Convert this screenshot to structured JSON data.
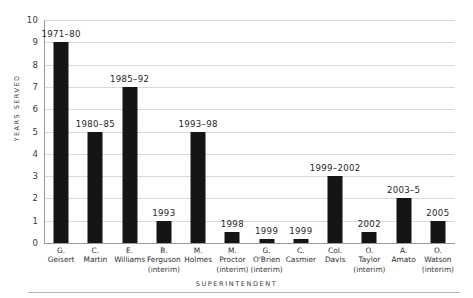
{
  "chart_data": {
    "type": "bar",
    "title": "",
    "xlabel": "SUPERINTENDENT",
    "ylabel": "YEARS SERVED",
    "ylim": [
      0,
      10
    ],
    "yticks": [
      10,
      9,
      8,
      7,
      6,
      5,
      4,
      3,
      2,
      1,
      0
    ],
    "grid": true,
    "legend": "none",
    "bar_color": "#151515",
    "gridline_color": "#d9d9d9",
    "categories": [
      "G. Geisert",
      "C. Martin",
      "E. Williams",
      "B. Ferguson (interim)",
      "M. Holmes",
      "M. Proctor (interim)",
      "G. O'Brien (interim)",
      "C. Casmier",
      "Col. Davis",
      "O. Taylor (interim)",
      "A. Amato",
      "O. Watson (interim)"
    ],
    "values": [
      9,
      5,
      7,
      1,
      5,
      0.5,
      0.2,
      0.2,
      3,
      0.5,
      2,
      1
    ],
    "bars": [
      {
        "name_line1": "G.",
        "name_line2": "Geisert",
        "interim": "",
        "value": 9,
        "label": "1971–80"
      },
      {
        "name_line1": "C.",
        "name_line2": "Martin",
        "interim": "",
        "value": 5,
        "label": "1980–85"
      },
      {
        "name_line1": "E.",
        "name_line2": "Williams",
        "interim": "",
        "value": 7,
        "label": "1985–92"
      },
      {
        "name_line1": "B.",
        "name_line2": "Ferguson",
        "interim": "(interim)",
        "value": 1,
        "label": "1993"
      },
      {
        "name_line1": "M.",
        "name_line2": "Holmes",
        "interim": "",
        "value": 5,
        "label": "1993–98"
      },
      {
        "name_line1": "M.",
        "name_line2": "Proctor",
        "interim": "(interim)",
        "value": 0.5,
        "label": "1998"
      },
      {
        "name_line1": "G.",
        "name_line2": "O'Brien",
        "interim": "(interim)",
        "value": 0.2,
        "label": "1999"
      },
      {
        "name_line1": "C.",
        "name_line2": "Casmier",
        "interim": "",
        "value": 0.2,
        "label": "1999"
      },
      {
        "name_line1": "Col.",
        "name_line2": "Davis",
        "interim": "",
        "value": 3,
        "label": "1999–2002"
      },
      {
        "name_line1": "O.",
        "name_line2": "Taylor",
        "interim": "(interim)",
        "value": 0.5,
        "label": "2002"
      },
      {
        "name_line1": "A.",
        "name_line2": "Amato",
        "interim": "",
        "value": 2,
        "label": "2003–5"
      },
      {
        "name_line1": "O.",
        "name_line2": "Watson",
        "interim": "(interim)",
        "value": 1,
        "label": "2005"
      }
    ]
  }
}
